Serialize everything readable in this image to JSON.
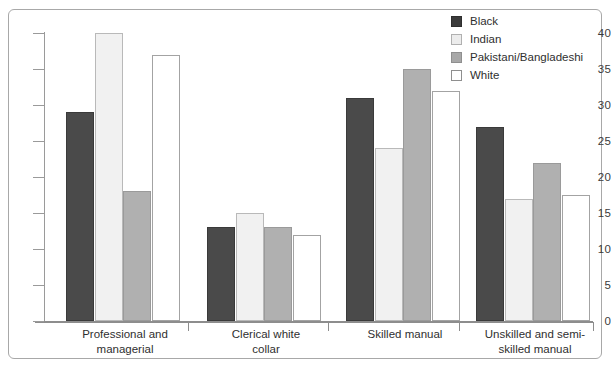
{
  "chart_data": {
    "type": "bar",
    "title": "",
    "subtitle": "",
    "xlabel": "",
    "ylabel": "",
    "ylim": [
      0,
      40
    ],
    "ytick_step": 5,
    "yticks": [
      "40",
      "35",
      "30",
      "25",
      "20",
      "15",
      "10",
      "5",
      "0"
    ],
    "grid": false,
    "legend_position": "top-right",
    "categories": [
      "Professional and managerial",
      "Clerical white collar",
      "Skilled manual",
      "Unskilled and semi-skilled manual"
    ],
    "category_lines": [
      [
        "Professional and",
        "managerial"
      ],
      [
        "Clerical white",
        "collar"
      ],
      [
        "Skilled manual",
        ""
      ],
      [
        "Unskilled and semi-",
        "skilled manual"
      ]
    ],
    "series": [
      {
        "name": "Black",
        "color": "#4a4a4a",
        "values": [
          29,
          13,
          31,
          27
        ]
      },
      {
        "name": "Indian",
        "color": "#f1f1f1",
        "values": [
          40,
          15,
          24,
          17
        ]
      },
      {
        "name": "Pakistani/Bangladeshi",
        "color": "#b0b0b0",
        "values": [
          18,
          13,
          35,
          22
        ]
      },
      {
        "name": "White",
        "color": "#ffffff",
        "values": [
          37,
          12,
          32,
          17.5
        ]
      }
    ]
  },
  "legend": {
    "items": [
      {
        "label": "Black",
        "swatch": "black"
      },
      {
        "label": "Indian",
        "swatch": "indian"
      },
      {
        "label": "Pakistani/Bangladeshi",
        "swatch": "pakbang"
      },
      {
        "label": "White",
        "swatch": "white"
      }
    ]
  }
}
